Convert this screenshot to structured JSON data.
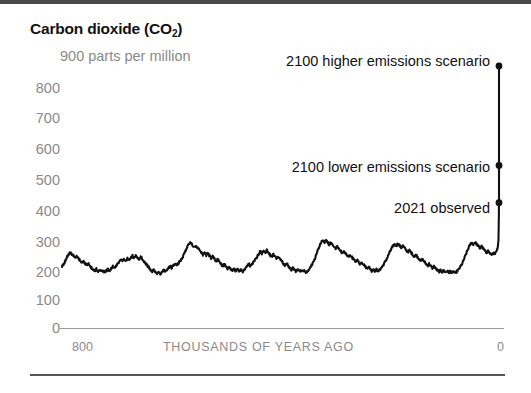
{
  "figure": {
    "title_main": "Carbon dioxide (CO",
    "title_sub": "2",
    "title_close": ")",
    "unit_label": "900 parts per million"
  },
  "annotations": {
    "higher": "2100 higher emissions scenario",
    "lower": "2100 lower emissions scenario",
    "observed": "2021 observed"
  },
  "chart_data": {
    "type": "line",
    "title": "Carbon dioxide (CO2)",
    "xlabel": "THOUSANDS OF YEARS AGO",
    "ylabel": "parts per million",
    "xlim": [
      800,
      0
    ],
    "ylim": [
      0,
      900
    ],
    "grid": false,
    "legend": "none",
    "yticks": [
      900,
      800,
      700,
      600,
      500,
      400,
      300,
      200,
      100,
      0
    ],
    "ytick_labels": [
      "900",
      "800",
      "700",
      "600",
      "500",
      "400",
      "300",
      "200",
      "100",
      "0"
    ],
    "xticks": [
      800,
      0
    ],
    "xtick_labels": [
      "800",
      "0"
    ],
    "series": [
      {
        "name": "ice core CO2 record",
        "x_units": "thousands of years ago",
        "y_units": "ppm",
        "points": [
          [
            800,
            205
          ],
          [
            797,
            212
          ],
          [
            794,
            222
          ],
          [
            791,
            236
          ],
          [
            788,
            245
          ],
          [
            785,
            252
          ],
          [
            782,
            246
          ],
          [
            779,
            240
          ],
          [
            776,
            233
          ],
          [
            773,
            238
          ],
          [
            770,
            230
          ],
          [
            767,
            224
          ],
          [
            764,
            218
          ],
          [
            761,
            224
          ],
          [
            758,
            215
          ],
          [
            755,
            209
          ],
          [
            752,
            214
          ],
          [
            749,
            206
          ],
          [
            746,
            200
          ],
          [
            743,
            194
          ],
          [
            740,
            189
          ],
          [
            737,
            196
          ],
          [
            734,
            188
          ],
          [
            731,
            193
          ],
          [
            728,
            186
          ],
          [
            725,
            191
          ],
          [
            722,
            184
          ],
          [
            719,
            190
          ],
          [
            716,
            196
          ],
          [
            713,
            191
          ],
          [
            710,
            197
          ],
          [
            707,
            204
          ],
          [
            704,
            198
          ],
          [
            701,
            205
          ],
          [
            698,
            212
          ],
          [
            695,
            219
          ],
          [
            692,
            226
          ],
          [
            689,
            221
          ],
          [
            686,
            228
          ],
          [
            683,
            222
          ],
          [
            680,
            230
          ],
          [
            677,
            224
          ],
          [
            674,
            232
          ],
          [
            671,
            240
          ],
          [
            668,
            234
          ],
          [
            665,
            241
          ],
          [
            662,
            235
          ],
          [
            659,
            228
          ],
          [
            656,
            236
          ],
          [
            653,
            230
          ],
          [
            650,
            222
          ],
          [
            647,
            215
          ],
          [
            644,
            208
          ],
          [
            641,
            201
          ],
          [
            638,
            194
          ],
          [
            635,
            188
          ],
          [
            632,
            193
          ],
          [
            629,
            186
          ],
          [
            626,
            181
          ],
          [
            623,
            187
          ],
          [
            620,
            180
          ],
          [
            617,
            186
          ],
          [
            614,
            192
          ],
          [
            611,
            186
          ],
          [
            608,
            193
          ],
          [
            605,
            199
          ],
          [
            602,
            206
          ],
          [
            599,
            200
          ],
          [
            596,
            207
          ],
          [
            593,
            214
          ],
          [
            590,
            208
          ],
          [
            587,
            215
          ],
          [
            584,
            222
          ],
          [
            581,
            230
          ],
          [
            578,
            240
          ],
          [
            575,
            252
          ],
          [
            572,
            265
          ],
          [
            569,
            275
          ],
          [
            566,
            284
          ],
          [
            563,
            278
          ],
          [
            560,
            272
          ],
          [
            557,
            266
          ],
          [
            554,
            272
          ],
          [
            551,
            265
          ],
          [
            548,
            258
          ],
          [
            545,
            250
          ],
          [
            542,
            243
          ],
          [
            539,
            250
          ],
          [
            536,
            242
          ],
          [
            533,
            248
          ],
          [
            530,
            240
          ],
          [
            527,
            232
          ],
          [
            524,
            238
          ],
          [
            521,
            230
          ],
          [
            518,
            222
          ],
          [
            515,
            228
          ],
          [
            512,
            220
          ],
          [
            509,
            213
          ],
          [
            506,
            206
          ],
          [
            503,
            212
          ],
          [
            500,
            204
          ],
          [
            497,
            197
          ],
          [
            494,
            203
          ],
          [
            491,
            196
          ],
          [
            488,
            190
          ],
          [
            485,
            196
          ],
          [
            482,
            189
          ],
          [
            479,
            195
          ],
          [
            476,
            188
          ],
          [
            473,
            194
          ],
          [
            470,
            187
          ],
          [
            467,
            193
          ],
          [
            464,
            199
          ],
          [
            461,
            206
          ],
          [
            458,
            213
          ],
          [
            455,
            206
          ],
          [
            452,
            213
          ],
          [
            449,
            220
          ],
          [
            446,
            228
          ],
          [
            443,
            236
          ],
          [
            440,
            246
          ],
          [
            437,
            255
          ],
          [
            434,
            248
          ],
          [
            431,
            256
          ],
          [
            428,
            250
          ],
          [
            425,
            258
          ],
          [
            422,
            250
          ],
          [
            419,
            243
          ],
          [
            416,
            236
          ],
          [
            413,
            244
          ],
          [
            410,
            237
          ],
          [
            407,
            230
          ],
          [
            404,
            237
          ],
          [
            401,
            230
          ],
          [
            398,
            222
          ],
          [
            395,
            215
          ],
          [
            392,
            208
          ],
          [
            389,
            214
          ],
          [
            386,
            207
          ],
          [
            383,
            200
          ],
          [
            380,
            194
          ],
          [
            377,
            200
          ],
          [
            374,
            193
          ],
          [
            371,
            187
          ],
          [
            368,
            193
          ],
          [
            365,
            186
          ],
          [
            362,
            192
          ],
          [
            359,
            185
          ],
          [
            356,
            191
          ],
          [
            353,
            184
          ],
          [
            350,
            190
          ],
          [
            347,
            197
          ],
          [
            344,
            205
          ],
          [
            341,
            214
          ],
          [
            338,
            226
          ],
          [
            335,
            240
          ],
          [
            332,
            256
          ],
          [
            329,
            270
          ],
          [
            326,
            282
          ],
          [
            323,
            290
          ],
          [
            320,
            284
          ],
          [
            317,
            291
          ],
          [
            314,
            285
          ],
          [
            311,
            278
          ],
          [
            308,
            284
          ],
          [
            305,
            277
          ],
          [
            302,
            270
          ],
          [
            299,
            264
          ],
          [
            296,
            270
          ],
          [
            293,
            263
          ],
          [
            290,
            256
          ],
          [
            287,
            249
          ],
          [
            284,
            256
          ],
          [
            281,
            248
          ],
          [
            278,
            241
          ],
          [
            275,
            234
          ],
          [
            272,
            241
          ],
          [
            269,
            234
          ],
          [
            266,
            227
          ],
          [
            263,
            220
          ],
          [
            260,
            227
          ],
          [
            257,
            219
          ],
          [
            254,
            212
          ],
          [
            251,
            219
          ],
          [
            248,
            212
          ],
          [
            245,
            205
          ],
          [
            242,
            198
          ],
          [
            239,
            204
          ],
          [
            236,
            197
          ],
          [
            233,
            190
          ],
          [
            230,
            196
          ],
          [
            227,
            189
          ],
          [
            224,
            195
          ],
          [
            221,
            188
          ],
          [
            218,
            194
          ],
          [
            215,
            201
          ],
          [
            212,
            209
          ],
          [
            209,
            218
          ],
          [
            206,
            228
          ],
          [
            203,
            240
          ],
          [
            200,
            252
          ],
          [
            197,
            263
          ],
          [
            194,
            272
          ],
          [
            191,
            279
          ],
          [
            188,
            273
          ],
          [
            185,
            280
          ],
          [
            182,
            274
          ],
          [
            179,
            267
          ],
          [
            176,
            273
          ],
          [
            173,
            266
          ],
          [
            170,
            259
          ],
          [
            167,
            252
          ],
          [
            164,
            258
          ],
          [
            161,
            251
          ],
          [
            158,
            244
          ],
          [
            155,
            237
          ],
          [
            152,
            243
          ],
          [
            149,
            236
          ],
          [
            146,
            229
          ],
          [
            143,
            222
          ],
          [
            140,
            228
          ],
          [
            137,
            221
          ],
          [
            134,
            214
          ],
          [
            131,
            207
          ],
          [
            128,
            213
          ],
          [
            125,
            206
          ],
          [
            122,
            199
          ],
          [
            119,
            205
          ],
          [
            116,
            198
          ],
          [
            113,
            192
          ],
          [
            110,
            186
          ],
          [
            107,
            192
          ],
          [
            104,
            186
          ],
          [
            101,
            191
          ],
          [
            98,
            185
          ],
          [
            95,
            190
          ],
          [
            92,
            184
          ],
          [
            89,
            189
          ],
          [
            86,
            183
          ],
          [
            83,
            188
          ],
          [
            80,
            182
          ],
          [
            77,
            188
          ],
          [
            74,
            194
          ],
          [
            71,
            202
          ],
          [
            68,
            212
          ],
          [
            65,
            224
          ],
          [
            62,
            238
          ],
          [
            59,
            252
          ],
          [
            56,
            265
          ],
          [
            53,
            276
          ],
          [
            50,
            284
          ],
          [
            47,
            278
          ],
          [
            44,
            285
          ],
          [
            41,
            279
          ],
          [
            38,
            272
          ],
          [
            35,
            265
          ],
          [
            32,
            271
          ],
          [
            29,
            264
          ],
          [
            26,
            257
          ],
          [
            23,
            250
          ],
          [
            20,
            256
          ],
          [
            17,
            249
          ],
          [
            14,
            243
          ],
          [
            11,
            250
          ],
          [
            8,
            244
          ],
          [
            5,
            252
          ],
          [
            3,
            262
          ],
          [
            2,
            272
          ],
          [
            1,
            292
          ],
          [
            0.5,
            340
          ],
          [
            0,
            416
          ]
        ]
      }
    ],
    "markers": [
      {
        "name": "2100 higher emissions scenario",
        "x": 0,
        "y": 870
      },
      {
        "name": "2100 lower emissions scenario",
        "x": 0,
        "y": 540
      },
      {
        "name": "2021 observed",
        "x": 0,
        "y": 416
      }
    ]
  }
}
